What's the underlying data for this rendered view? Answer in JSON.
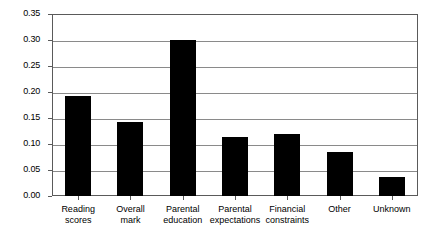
{
  "chart_data": {
    "type": "bar",
    "title": "",
    "subtitle": "",
    "xlabel": "",
    "ylabel": "",
    "categories": [
      "Reading\nscores",
      "Overall\nmark",
      "Parental\neducation",
      "Parental\nexpectations",
      "Financial\nconstraints",
      "Other",
      "Unknown"
    ],
    "values": [
      0.193,
      0.143,
      0.3,
      0.114,
      0.119,
      0.085,
      0.037
    ],
    "ylim": [
      0.0,
      0.35
    ],
    "ytick_labels": [
      "0.35",
      "0.30",
      "0.25",
      "0.20",
      "0.15",
      "0.10",
      "0.05",
      "0.00"
    ],
    "ytick_values": [
      0.35,
      0.3,
      0.25,
      0.2,
      0.15,
      0.1,
      0.05,
      0.0
    ],
    "grid": true,
    "legend": "none",
    "bar_color": "#000000",
    "grid_color": "#8a8a8a",
    "frame_color": "#5a5a5a",
    "background_color": "#ffffff"
  }
}
